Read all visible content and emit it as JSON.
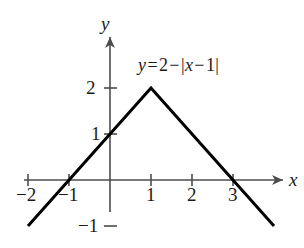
{
  "chart_data": {
    "type": "line",
    "title": "",
    "equation_label": "y = 2 − |x − 1|",
    "equation_parts": {
      "y": "y",
      "equals": "=",
      "two": "2",
      "minus1": "−",
      "open_bar": "|",
      "x": "x",
      "minus2": "−",
      "one": "1",
      "close_bar": "|"
    },
    "xlabel": "x",
    "ylabel": "y",
    "xlim": [
      -2.6,
      4.1
    ],
    "ylim": [
      -1.45,
      2.55
    ],
    "grid": false,
    "legend": false,
    "series": [
      {
        "name": "y = 2 - |x - 1|",
        "color": "#000000",
        "linewidth": 3,
        "x": [
          -2.0,
          1.0,
          4.0
        ],
        "y": [
          -1.0,
          2.0,
          -1.0
        ]
      }
    ],
    "vertex": {
      "x": 1,
      "y": 2
    },
    "x_intercepts": [
      -1,
      3
    ],
    "y_intercept": 1,
    "xticks": [
      {
        "value": -2,
        "label": "−2"
      },
      {
        "value": -1,
        "label": "−1"
      },
      {
        "value": 1,
        "label": "1"
      },
      {
        "value": 2,
        "label": "2"
      },
      {
        "value": 3,
        "label": "3"
      }
    ],
    "yticks": [
      {
        "value": 2,
        "label": "2"
      },
      {
        "value": 1,
        "label": "1"
      },
      {
        "value": -1,
        "label": "−1"
      }
    ],
    "axis_color": "#4d4d4d",
    "curve_color": "#000000",
    "background": "#ffffff"
  },
  "axes": {
    "x_axis_name": "x",
    "y_axis_name": "y"
  }
}
